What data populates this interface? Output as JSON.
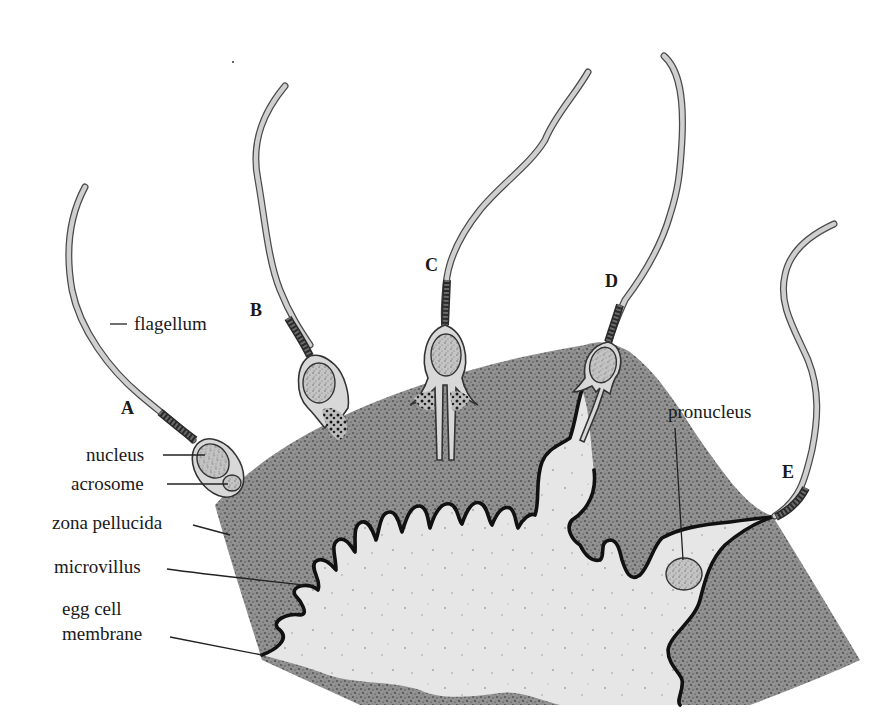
{
  "figure": {
    "colors": {
      "zona_pellucida": "#8c8c8c",
      "egg_cytoplasm": "#e6e6e6",
      "sperm_head": "#d8d8d8",
      "membrane": "#111111",
      "background": "#ffffff"
    }
  },
  "stages": [
    {
      "id": "A",
      "label": "A"
    },
    {
      "id": "B",
      "label": "B"
    },
    {
      "id": "C",
      "label": "C"
    },
    {
      "id": "D",
      "label": "D"
    },
    {
      "id": "E",
      "label": "E"
    }
  ],
  "labels": {
    "flagellum": "flagellum",
    "nucleus": "nucleus",
    "acrosome": "acrosome",
    "zona_pellucida": "zona pellucida",
    "microvillus": "microvillus",
    "egg_cell_membrane_line1": "egg cell",
    "egg_cell_membrane_line2": "membrane",
    "pronucleus": "pronucleus"
  }
}
